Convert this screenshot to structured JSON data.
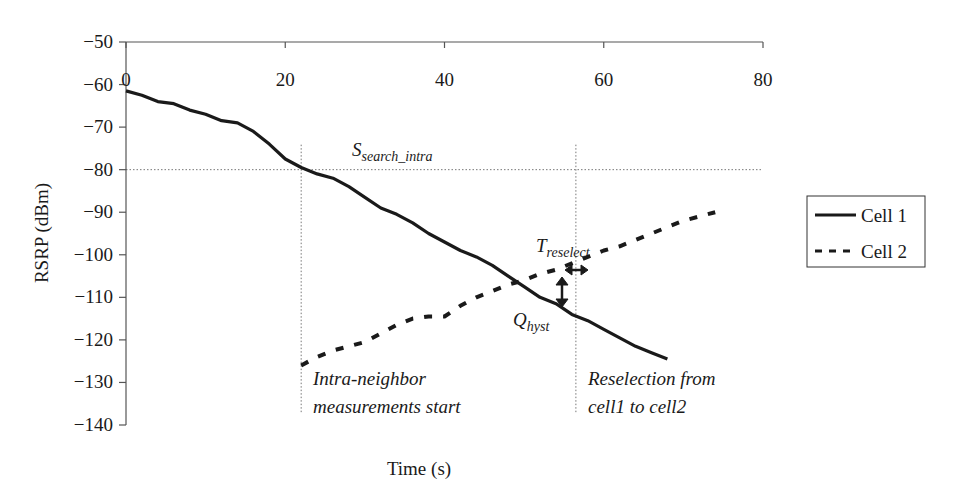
{
  "chart_data": {
    "type": "line",
    "title": "",
    "xlabel": "Time (s)",
    "ylabel": "RSRP (dBm)",
    "xlim": [
      0,
      80
    ],
    "ylim": [
      -140,
      -50
    ],
    "x_ticks": [
      0,
      20,
      40,
      60,
      80
    ],
    "y_ticks": [
      -50,
      -60,
      -70,
      -80,
      -90,
      -100,
      -110,
      -120,
      -130,
      -140
    ],
    "x_axis_position": "top",
    "grid": false,
    "legend_position": "right",
    "series": [
      {
        "name": "Cell 1",
        "style": "solid",
        "x": [
          0,
          2,
          4,
          6,
          8,
          10,
          12,
          14,
          16,
          18,
          20,
          22,
          24,
          26,
          28,
          30,
          32,
          34,
          36,
          38,
          40,
          42,
          44,
          46,
          48,
          50,
          52,
          54,
          56,
          58,
          60,
          62,
          64,
          66,
          68
        ],
        "values": [
          -61.5,
          -62.5,
          -64,
          -64.5,
          -66,
          -67,
          -68.5,
          -69,
          -71,
          -74,
          -77.5,
          -79.5,
          -81,
          -82,
          -84,
          -86.5,
          -89,
          -90.5,
          -92.5,
          -95,
          -97,
          -99,
          -100.5,
          -102.5,
          -105,
          -107.5,
          -110,
          -111.5,
          -114,
          -115.5,
          -117.5,
          -119.5,
          -121.5,
          -123,
          -124.5
        ]
      },
      {
        "name": "Cell 2",
        "style": "dashed",
        "x": [
          22,
          24,
          26,
          28,
          30,
          32,
          34,
          36,
          38,
          40,
          42,
          44,
          46,
          48,
          50,
          52,
          54,
          56,
          58,
          60,
          62,
          64,
          66,
          68,
          70,
          72,
          74
        ],
        "values": [
          -126,
          -124,
          -122.5,
          -121.5,
          -120.5,
          -118.5,
          -116.5,
          -115,
          -114.5,
          -114.5,
          -112,
          -110,
          -108.5,
          -107,
          -106,
          -104.5,
          -103.5,
          -102,
          -100.5,
          -99,
          -98,
          -96.5,
          -95,
          -93.5,
          -92,
          -91,
          -90
        ]
      }
    ],
    "reference_lines": [
      {
        "orientation": "horizontal",
        "value": -80,
        "style": "dotted",
        "label": "S_search_intra"
      },
      {
        "orientation": "vertical",
        "value": 22,
        "style": "dotted",
        "range": [
          -137,
          -80
        ]
      },
      {
        "orientation": "vertical",
        "value": 56.5,
        "style": "dotted",
        "range": [
          -137,
          -80
        ]
      }
    ],
    "annotations": [
      {
        "text": "S",
        "subscript": "search_intra",
        "x": 28,
        "y": -78
      },
      {
        "text": "T",
        "subscript": "reselect",
        "x": 49,
        "y": -101,
        "marker": "horizontal double arrow"
      },
      {
        "text": "Q",
        "subscript": "hyst",
        "x": 48,
        "y": -118,
        "marker": "vertical double arrow"
      },
      {
        "text": "Intra-neighbor measurements start",
        "x": 24,
        "y": -130
      },
      {
        "text": "Reselection from cell1 to cell2",
        "x": 58,
        "y": -130
      }
    ]
  },
  "labels": {
    "y_axis_title": "RSRP (dBm)",
    "x_axis_title": "Time (s)",
    "s_main": "S",
    "s_sub": "search_intra",
    "t_main": "T",
    "t_sub": "reselect",
    "q_main": "Q",
    "q_sub": "hyst",
    "intra_line1": "Intra-neighbor",
    "intra_line2": "measurements start",
    "resel_line1": "Reselection from",
    "resel_line2": "cell1 to cell2"
  },
  "legend": {
    "items": [
      {
        "label": "Cell 1",
        "style": "solid"
      },
      {
        "label": "Cell 2",
        "style": "dashed"
      }
    ]
  },
  "colors": {
    "line": "#1a1a1a",
    "axis": "#555555",
    "reference": "#777777"
  }
}
